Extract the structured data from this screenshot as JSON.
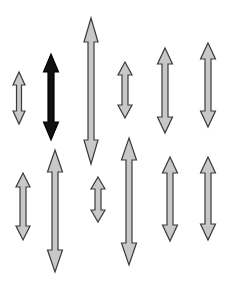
{
  "canvas": {
    "width": 227,
    "height": 283,
    "background": "#ffffff"
  },
  "colors": {
    "distractor_fill": "#c8c8c8",
    "distractor_stroke": "#3a3a3a",
    "target_fill": "#111111",
    "target_stroke": "#000000"
  },
  "stimulus": {
    "description": "Array of vertical double-headed arrows; one black target among gray distractors",
    "arrows": [
      {
        "id": 1,
        "row": "top",
        "cx": 19,
        "y1": 72,
        "y2": 124,
        "shaft_w": 5,
        "head_w": 12,
        "head_h": 13,
        "type": "distractor"
      },
      {
        "id": 2,
        "row": "top",
        "cx": 51,
        "y1": 54,
        "y2": 140,
        "shaft_w": 6,
        "head_w": 15,
        "head_h": 18,
        "type": "target"
      },
      {
        "id": 3,
        "row": "top",
        "cx": 91,
        "y1": 18,
        "y2": 164,
        "shaft_w": 6,
        "head_w": 14,
        "head_h": 24,
        "type": "distractor"
      },
      {
        "id": 4,
        "row": "top",
        "cx": 125,
        "y1": 62,
        "y2": 118,
        "shaft_w": 6,
        "head_w": 14,
        "head_h": 13,
        "type": "distractor"
      },
      {
        "id": 5,
        "row": "top",
        "cx": 165,
        "y1": 48,
        "y2": 133,
        "shaft_w": 6,
        "head_w": 15,
        "head_h": 16,
        "type": "distractor"
      },
      {
        "id": 6,
        "row": "top",
        "cx": 208,
        "y1": 43,
        "y2": 127,
        "shaft_w": 6,
        "head_w": 15,
        "head_h": 16,
        "type": "distractor"
      },
      {
        "id": 7,
        "row": "bottom",
        "cx": 23,
        "y1": 173,
        "y2": 240,
        "shaft_w": 6,
        "head_w": 14,
        "head_h": 14,
        "type": "distractor"
      },
      {
        "id": 8,
        "row": "bottom",
        "cx": 55,
        "y1": 150,
        "y2": 272,
        "shaft_w": 6,
        "head_w": 15,
        "head_h": 22,
        "type": "distractor"
      },
      {
        "id": 9,
        "row": "bottom",
        "cx": 98,
        "y1": 177,
        "y2": 222,
        "shaft_w": 6,
        "head_w": 14,
        "head_h": 12,
        "type": "distractor"
      },
      {
        "id": 10,
        "row": "bottom",
        "cx": 129,
        "y1": 138,
        "y2": 265,
        "shaft_w": 6,
        "head_w": 15,
        "head_h": 22,
        "type": "distractor"
      },
      {
        "id": 11,
        "row": "bottom",
        "cx": 170,
        "y1": 157,
        "y2": 241,
        "shaft_w": 6,
        "head_w": 15,
        "head_h": 16,
        "type": "distractor"
      },
      {
        "id": 12,
        "row": "bottom",
        "cx": 208,
        "y1": 157,
        "y2": 240,
        "shaft_w": 6,
        "head_w": 15,
        "head_h": 16,
        "type": "distractor"
      }
    ]
  }
}
